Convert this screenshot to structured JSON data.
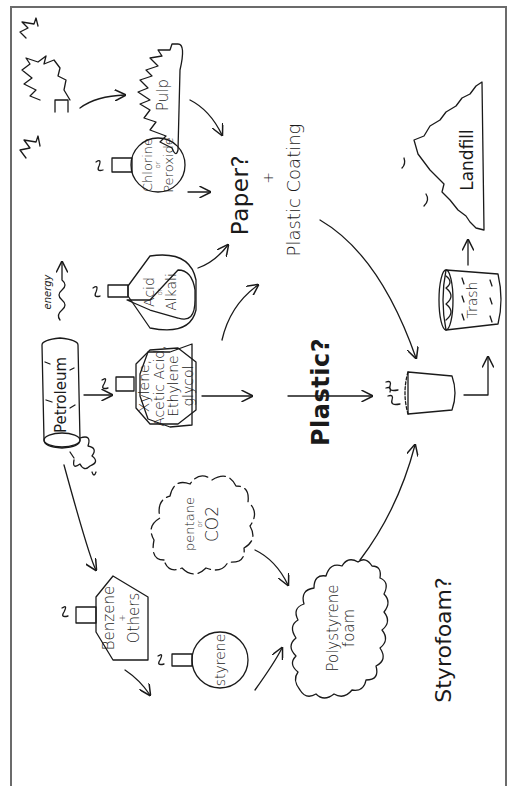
{
  "diagram": {
    "nodes": {
      "trees": {
        "label": ""
      },
      "pulp": {
        "label": "Pulp"
      },
      "chlorine_peroxide": {
        "line1": "Chlorine",
        "connector": "or",
        "line2": "Peroxide"
      },
      "acid_alkali": {
        "line1": "Acid",
        "connector": "or",
        "line2": "Alkali"
      },
      "paper": {
        "label": "Paper?"
      },
      "plus": {
        "label": "+"
      },
      "plastic_coating": {
        "label": "Plastic Coating"
      },
      "petroleum": {
        "label": "Petroleum"
      },
      "energy": {
        "label": "energy"
      },
      "xylene": {
        "line1": "Xylene,",
        "line2": "Acetic Acid,",
        "line3": "Ethylene",
        "line4": "glycol"
      },
      "plastic": {
        "label": "Plastic?"
      },
      "cup": {
        "label": ""
      },
      "trash": {
        "label": "Trash"
      },
      "landfill": {
        "label": "Landfill"
      },
      "benzene": {
        "line1": "Benzene",
        "connector": "+",
        "line2": "Others"
      },
      "pentane_co2": {
        "line1": "pentane",
        "connector": "or",
        "line2": "CO2"
      },
      "styrene": {
        "label": "styrene"
      },
      "polystyrene": {
        "line1": "Polystyrene",
        "line2": "foam"
      },
      "styrofoam": {
        "label": "Styrofoam?"
      }
    },
    "edges": [
      {
        "from": "trees",
        "to": "pulp"
      },
      {
        "from": "pulp",
        "to": "paper"
      },
      {
        "from": "chlorine_peroxide",
        "to": "paper"
      },
      {
        "from": "acid_alkali",
        "to": "paper"
      },
      {
        "from": "petroleum",
        "to": "energy"
      },
      {
        "from": "petroleum",
        "to": "xylene"
      },
      {
        "from": "petroleum",
        "to": "benzene"
      },
      {
        "from": "xylene",
        "to": "plastic_coating"
      },
      {
        "from": "xylene",
        "to": "plastic"
      },
      {
        "from": "plastic",
        "to": "cup"
      },
      {
        "from": "plastic_coating",
        "to": "cup"
      },
      {
        "from": "benzene",
        "to": "styrene"
      },
      {
        "from": "styrene",
        "to": "polystyrene"
      },
      {
        "from": "pentane_co2",
        "to": "polystyrene"
      },
      {
        "from": "polystyrene",
        "to": "cup"
      },
      {
        "from": "cup",
        "to": "trash"
      },
      {
        "from": "trash",
        "to": "landfill"
      }
    ],
    "colors": {
      "ink": "#1a1a1a",
      "frame": "#6b6b6b",
      "background": "#ffffff"
    }
  }
}
